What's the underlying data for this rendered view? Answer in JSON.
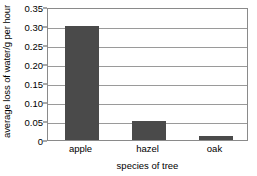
{
  "chart_data": {
    "type": "bar",
    "title": "",
    "categories": [
      "apple",
      "hazel",
      "oak"
    ],
    "values": [
      0.3,
      0.05,
      0.01
    ],
    "series": [
      {
        "name": "average loss of water/g per hour",
        "values": [
          0.3,
          0.05,
          0.01
        ]
      }
    ],
    "xlabel": "species of tree",
    "ylabel": "average loss of water/g per hour",
    "ylim": [
      0,
      0.35
    ],
    "ytick_labels": [
      "0",
      "0.05",
      "0.10",
      "0.15",
      "0.20",
      "0.25",
      "0.30",
      "0.35"
    ],
    "ytick_values": [
      0,
      0.05,
      0.1,
      0.15,
      0.2,
      0.25,
      0.3,
      0.35
    ],
    "grid": "horizontal",
    "legend": "none",
    "bar_color": "#4a4a4a",
    "grid_color": "#9a9a9a",
    "frame_color": "#8a8a8a",
    "background_color": "#ffffff"
  },
  "axis": {
    "y_title": "average loss of water/g per hour",
    "x_title": "species of tree"
  },
  "yticks": [
    {
      "label": "0.35",
      "value": 0.35
    },
    {
      "label": "0.30",
      "value": 0.3
    },
    {
      "label": "0.25",
      "value": 0.25
    },
    {
      "label": "0.20",
      "value": 0.2
    },
    {
      "label": "0.15",
      "value": 0.15
    },
    {
      "label": "0.10",
      "value": 0.1
    },
    {
      "label": "0.05",
      "value": 0.05
    },
    {
      "label": "0",
      "value": 0
    }
  ],
  "bars": [
    {
      "label": "apple",
      "value": 0.3
    },
    {
      "label": "hazel",
      "value": 0.05
    },
    {
      "label": "oak",
      "value": 0.01
    }
  ]
}
